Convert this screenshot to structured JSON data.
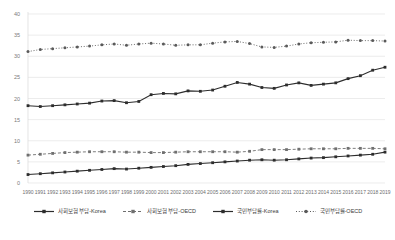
{
  "chart_data": {
    "type": "line",
    "title": "",
    "subtitle": "",
    "xlabel": "",
    "ylabel": "",
    "ylim": [
      0,
      40
    ],
    "xlim": [
      1990,
      2019
    ],
    "yticks": [
      0,
      5,
      10,
      15,
      20,
      25,
      30,
      35,
      40
    ],
    "grid": true,
    "legend_position": "bottom",
    "x": [
      1990,
      1991,
      1992,
      1993,
      1994,
      1995,
      1996,
      1997,
      1998,
      1999,
      2000,
      2001,
      2002,
      2003,
      2004,
      2005,
      2006,
      2007,
      2008,
      2009,
      2010,
      2011,
      2012,
      2013,
      2014,
      2015,
      2016,
      2017,
      2018,
      2019
    ],
    "xtick_labels": [
      "1990",
      "1991",
      "1992",
      "1993",
      "1994",
      "1995",
      "1996",
      "1997",
      "1998",
      "1999",
      "2000",
      "2001",
      "2002",
      "2003",
      "2004",
      "2005",
      "2006",
      "2007",
      "2008",
      "2009",
      "2010",
      "2011",
      "2012",
      "2013",
      "2014",
      "2015",
      "2016",
      "2017",
      "2018",
      "2019"
    ],
    "series": [
      {
        "name": "사회보험 부담-Korea",
        "style": "solid",
        "color": "#2d2d2d",
        "marker": "square",
        "values": [
          2.0,
          2.2,
          2.4,
          2.6,
          2.8,
          3.0,
          3.2,
          3.4,
          3.3,
          3.5,
          3.7,
          3.9,
          4.1,
          4.4,
          4.6,
          4.8,
          5.0,
          5.2,
          5.4,
          5.5,
          5.4,
          5.5,
          5.7,
          5.9,
          6.0,
          6.2,
          6.4,
          6.6,
          6.8,
          7.3
        ]
      },
      {
        "name": "사회보험 부담-OECD",
        "style": "dashed",
        "color": "#6f6f6f",
        "marker": "square",
        "values": [
          6.6,
          6.8,
          7.0,
          7.2,
          7.3,
          7.4,
          7.4,
          7.4,
          7.3,
          7.3,
          7.2,
          7.2,
          7.3,
          7.4,
          7.4,
          7.4,
          7.4,
          7.3,
          7.5,
          7.9,
          7.9,
          7.9,
          8.0,
          8.1,
          8.1,
          8.1,
          8.2,
          8.2,
          8.2,
          8.1
        ]
      },
      {
        "name": "국민부담률-Korea",
        "style": "solid",
        "color": "#2d2d2d",
        "marker": "square",
        "values": [
          18.3,
          18.1,
          18.3,
          18.5,
          18.7,
          18.9,
          19.4,
          19.5,
          19.0,
          19.3,
          20.9,
          21.2,
          21.1,
          21.8,
          21.7,
          22.0,
          22.9,
          23.8,
          23.4,
          22.6,
          22.4,
          23.2,
          23.7,
          23.1,
          23.4,
          23.7,
          24.7,
          25.4,
          26.7,
          27.4
        ]
      },
      {
        "name": "국민부담률-OECD",
        "style": "dotted",
        "color": "#5a5a5a",
        "marker": "circle",
        "values": [
          31.1,
          31.6,
          31.8,
          32.0,
          32.2,
          32.4,
          32.7,
          32.9,
          32.6,
          32.9,
          33.1,
          32.9,
          32.6,
          32.7,
          32.7,
          33.1,
          33.4,
          33.5,
          33.0,
          32.2,
          32.1,
          32.4,
          32.9,
          33.2,
          33.3,
          33.4,
          33.8,
          33.7,
          33.7,
          33.6
        ]
      }
    ]
  }
}
